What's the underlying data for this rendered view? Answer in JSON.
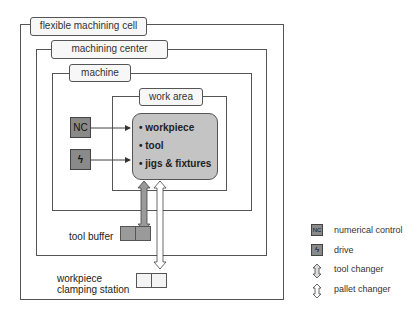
{
  "levels": {
    "cell": "flexible machining cell",
    "center": "machining center",
    "machine": "machine",
    "work_area": "work area"
  },
  "work_area_items": [
    "• workpiece",
    "• tool",
    "• jigs & fixtures"
  ],
  "nc_label": "NC",
  "drive_glyph": "ϟ",
  "tool_buffer": "tool buffer",
  "clamping_station": [
    "workpiece",
    "clamping station"
  ],
  "legend": [
    {
      "icon": "nc-icon",
      "label": "numerical control"
    },
    {
      "icon": "drive-icon",
      "label": "drive"
    },
    {
      "icon": "tool-changer-icon",
      "label": "tool changer"
    },
    {
      "icon": "pallet-changer-icon",
      "label": "pallet changer"
    }
  ],
  "colors": {
    "tool_changer": "#9a9a9a",
    "pallet_changer": "#ffffff",
    "core": "#c4c4c4",
    "buffer": "#9a9a9a"
  }
}
